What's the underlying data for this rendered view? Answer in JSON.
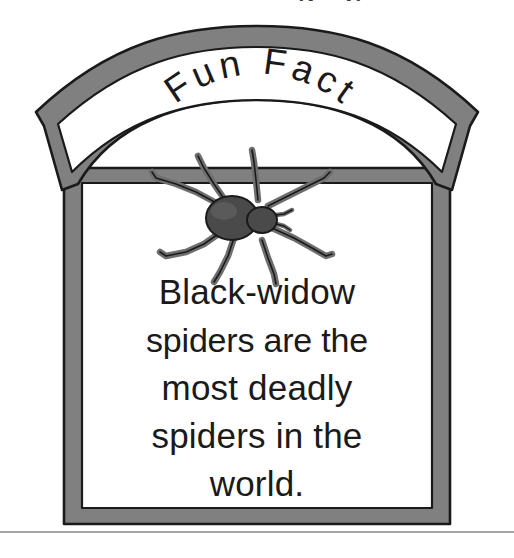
{
  "image": {
    "kind": "illustration",
    "subject": "fun-fact-signpost",
    "background_color": "#ffffff",
    "width": 514,
    "height": 558
  },
  "sign": {
    "banner_title": "Fun Fact",
    "frame_fill_color": "#808080",
    "frame_outline_color": "#1a1a1a",
    "panel_fill_color": "#ffffff",
    "text_color": "#1a1a1a"
  },
  "illustration": {
    "name": "black-widow-spider",
    "body_color": "#4a4a4a",
    "leg_color": "#6e6e6e",
    "outline_color": "#1a1a1a",
    "leg_count": 8
  },
  "fact": {
    "lines": [
      "Black-widow",
      "spiders are the",
      "most deadly",
      "spiders in the",
      "world."
    ],
    "full_text": "Black-widow spiders are the most deadly spiders in the world."
  },
  "ground": {
    "line_color": "#8a8a8a"
  },
  "cropped_top_text": {
    "fragment_left": "g",
    "fragment_right": "p"
  }
}
